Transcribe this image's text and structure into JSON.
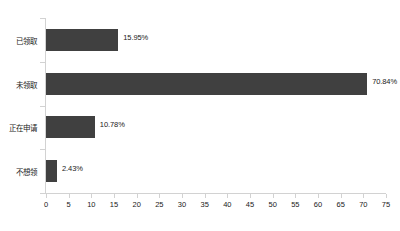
{
  "chart_data": {
    "type": "bar",
    "orientation": "horizontal",
    "title": "",
    "subtitle": "",
    "xlabel": "",
    "ylabel": "",
    "categories": [
      "已领取",
      "未领取",
      "正在申请",
      "不想领"
    ],
    "values": [
      15.95,
      70.84,
      10.78,
      2.43
    ],
    "value_labels": [
      "15.95%",
      "70.84%",
      "10.78%",
      "2.43%"
    ],
    "xlim": [
      0,
      75
    ],
    "xticks": [
      0,
      5,
      10,
      15,
      20,
      25,
      30,
      35,
      40,
      45,
      50,
      55,
      60,
      65,
      70,
      75
    ],
    "xtick_labels": [
      "0",
      "5",
      "10",
      "15",
      "20",
      "25",
      "30",
      "35",
      "40",
      "45",
      "50",
      "55",
      "60",
      "65",
      "70",
      "75"
    ],
    "grid": false,
    "legend": false,
    "legend_position": "none",
    "colors": {
      "bar": "#404040",
      "axis": "#d2d2d2",
      "text": "#1a1a1a",
      "background": "#ffffff"
    }
  }
}
